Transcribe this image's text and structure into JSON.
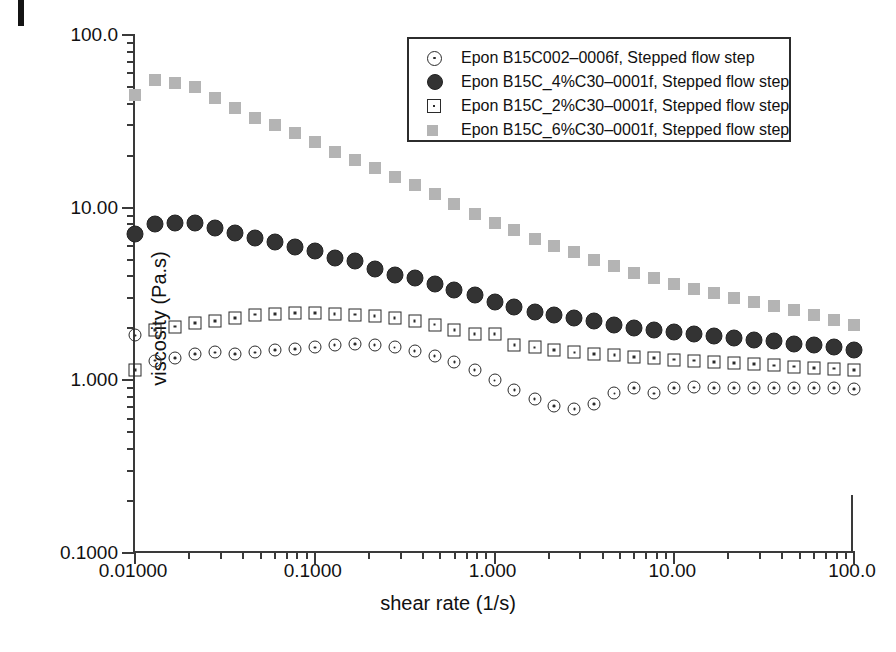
{
  "chart_data": {
    "type": "scatter",
    "title": "",
    "xlabel": "shear rate (1/s)",
    "ylabel": "viscosity (Pa.s)",
    "xscale": "log",
    "yscale": "log",
    "xlim": [
      0.01,
      100.0
    ],
    "ylim": [
      0.1,
      100.0
    ],
    "grid": false,
    "legend_position": "top-right",
    "xticklabels": [
      "0.01000",
      "0.1000",
      "1.000",
      "10.00",
      "100.0"
    ],
    "xtickvalues": [
      0.01,
      0.1,
      1.0,
      10.0,
      100.0
    ],
    "yticklabels": [
      "100.0",
      "10.00",
      "1.000",
      "0.1000"
    ],
    "ytickvalues": [
      100.0,
      10.0,
      1.0,
      0.1
    ],
    "series": [
      {
        "name": "Epon B15C002-0006f, Stepped flow step",
        "marker": "open-circle-dot",
        "color": "#2b2b2b",
        "x": [
          0.01,
          0.0129,
          0.0167,
          0.0215,
          0.0278,
          0.0359,
          0.0464,
          0.0599,
          0.0774,
          0.1,
          0.129,
          0.167,
          0.215,
          0.278,
          0.359,
          0.464,
          0.599,
          0.774,
          1.0,
          1.29,
          1.67,
          2.15,
          2.78,
          3.59,
          4.64,
          5.99,
          7.74,
          10.0,
          12.9,
          16.7,
          21.5,
          27.8,
          35.9,
          46.4,
          59.9,
          77.4,
          100.0
        ],
        "y": [
          1.82,
          1.3,
          1.35,
          1.42,
          1.45,
          1.42,
          1.45,
          1.5,
          1.52,
          1.55,
          1.6,
          1.62,
          1.6,
          1.55,
          1.48,
          1.38,
          1.28,
          1.15,
          1.0,
          0.88,
          0.78,
          0.71,
          0.68,
          0.73,
          0.84,
          0.9,
          0.84,
          0.9,
          0.91,
          0.9,
          0.9,
          0.9,
          0.9,
          0.9,
          0.9,
          0.9,
          0.89
        ]
      },
      {
        "name": "Epon B15C_4%C30-0001f, Stepped flow step",
        "marker": "filled-circle",
        "color": "#333333",
        "x": [
          0.01,
          0.0129,
          0.0167,
          0.0215,
          0.0278,
          0.0359,
          0.0464,
          0.0599,
          0.0774,
          0.1,
          0.129,
          0.167,
          0.215,
          0.278,
          0.359,
          0.464,
          0.599,
          0.774,
          1.0,
          1.29,
          1.67,
          2.15,
          2.78,
          3.59,
          4.64,
          5.99,
          7.74,
          10.0,
          12.9,
          16.7,
          21.5,
          27.8,
          35.9,
          46.4,
          59.9,
          77.4,
          100.0
        ],
        "y": [
          7.0,
          8.0,
          8.1,
          8.1,
          7.6,
          7.1,
          6.7,
          6.3,
          5.9,
          5.6,
          5.1,
          4.9,
          4.4,
          4.1,
          3.9,
          3.6,
          3.35,
          3.1,
          2.85,
          2.65,
          2.5,
          2.4,
          2.3,
          2.2,
          2.1,
          2.0,
          1.95,
          1.9,
          1.85,
          1.8,
          1.75,
          1.72,
          1.68,
          1.63,
          1.6,
          1.55,
          1.5
        ]
      },
      {
        "name": "Epon B15C_2%C30-0001f, Stepped flow step",
        "marker": "open-square-dot",
        "color": "#2b2b2b",
        "x": [
          0.01,
          0.0129,
          0.0167,
          0.0215,
          0.0278,
          0.0359,
          0.0464,
          0.0599,
          0.0774,
          0.1,
          0.129,
          0.167,
          0.215,
          0.278,
          0.359,
          0.464,
          0.599,
          0.774,
          1.0,
          1.29,
          1.67,
          2.15,
          2.78,
          3.59,
          4.64,
          5.99,
          7.74,
          10.0,
          12.9,
          16.7,
          21.5,
          27.8,
          35.9,
          46.4,
          59.9,
          77.4,
          100.0
        ],
        "y": [
          1.15,
          1.95,
          2.05,
          2.15,
          2.2,
          2.3,
          2.4,
          2.42,
          2.45,
          2.45,
          2.42,
          2.4,
          2.35,
          2.3,
          2.2,
          2.1,
          1.95,
          1.85,
          1.85,
          1.6,
          1.55,
          1.5,
          1.45,
          1.42,
          1.4,
          1.37,
          1.35,
          1.32,
          1.3,
          1.28,
          1.26,
          1.24,
          1.22,
          1.2,
          1.18,
          1.17,
          1.15
        ]
      },
      {
        "name": "Epon B15C_6%C30-0001f, Stepped flow step",
        "marker": "filled-square-gray",
        "color": "#b4b4b4",
        "x": [
          0.01,
          0.0129,
          0.0167,
          0.0215,
          0.0278,
          0.0359,
          0.0464,
          0.0599,
          0.0774,
          0.1,
          0.129,
          0.167,
          0.215,
          0.278,
          0.359,
          0.464,
          0.599,
          0.774,
          1.0,
          1.29,
          1.67,
          2.15,
          2.78,
          3.59,
          4.64,
          5.99,
          7.74,
          10.0,
          12.9,
          16.7,
          21.5,
          27.8,
          35.9,
          46.4,
          59.9,
          77.4,
          100.0
        ],
        "y": [
          45.0,
          55.0,
          53.0,
          50.0,
          43.0,
          38.0,
          33.0,
          30.0,
          27.0,
          24.0,
          21.0,
          19.0,
          17.0,
          15.0,
          13.5,
          12.0,
          10.5,
          9.2,
          8.2,
          7.4,
          6.6,
          6.0,
          5.5,
          5.0,
          4.6,
          4.2,
          3.9,
          3.6,
          3.4,
          3.2,
          3.0,
          2.85,
          2.7,
          2.55,
          2.4,
          2.25,
          2.1
        ]
      }
    ]
  },
  "legend": {
    "items": [
      {
        "label": "Epon B15C002–0006f, Stepped flow step",
        "marker": "open-circle-dot"
      },
      {
        "label": "Epon B15C_4%C30–0001f, Stepped flow step",
        "marker": "filled-circle"
      },
      {
        "label": "Epon B15C_2%C30–0001f, Stepped flow step",
        "marker": "open-square-dot"
      },
      {
        "label": "Epon B15C_6%C30–0001f, Stepped flow step",
        "marker": "filled-square-gray"
      }
    ]
  },
  "axes": {
    "x_title": "shear rate (1/s)",
    "y_title": "viscosity (Pa.s)",
    "x_ticklabels": [
      "0.01000",
      "0.1000",
      "1.000",
      "10.00",
      "100.0"
    ],
    "y_ticklabels": [
      "100.0",
      "10.00",
      "1.000",
      "0.1000"
    ]
  },
  "colors": {
    "axis": "#3a3a3a",
    "text": "#111111",
    "series_dark": "#333333",
    "series_gray": "#b4b4b4",
    "legend_border": "#2c2c2c"
  }
}
